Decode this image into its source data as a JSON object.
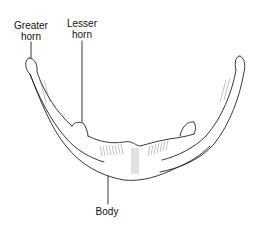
{
  "diagram": {
    "labels": {
      "greater_horn_line1": "Greater",
      "greater_horn_line2": "horn",
      "lesser_horn_line1": "Lesser",
      "lesser_horn_line2": "horn",
      "body": "Body"
    }
  }
}
